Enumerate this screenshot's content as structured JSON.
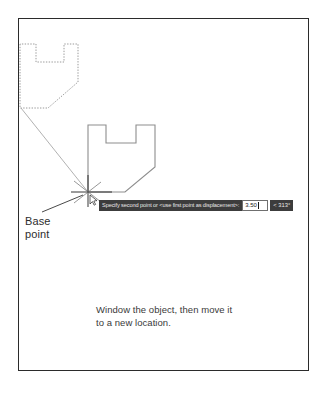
{
  "figure": {
    "frame_color": "#2b2b2b",
    "background": "#ffffff"
  },
  "annotations": {
    "base_point_label": "Base\npoint",
    "caption": "Window the object, then move it\nto a new location."
  },
  "command_bar": {
    "prompt": "Specify second point or <use first point as displacement>:",
    "distance_value": "3.50",
    "angle_value": "< 313°",
    "prompt_bg": "#3c3c3c",
    "prompt_fg": "#e8e8e8",
    "input_bg": "#ffffff",
    "input_fg": "#1a1a1a"
  },
  "geometry": {
    "ghost_shape": {
      "name": "ghost-object-outline",
      "style": "dotted",
      "stroke": "#9a9a9a",
      "points": "20,44 20,108 48,108 78,82 78,44 64,44 64,62 36,62 36,44"
    },
    "solid_shape": {
      "name": "moved-object-outline",
      "style": "solid",
      "stroke": "#8d8d8d",
      "points": "88,125 88,192 125,192 155,167 155,125 136,125 136,143 106,143 106,125"
    },
    "leader_line": {
      "name": "ghost-to-basepoint-leader",
      "stroke": "#8d8d8d",
      "x1": 21,
      "y1": 108,
      "x2": 88,
      "y2": 192
    },
    "label_leader_line": {
      "name": "base-point-leader",
      "stroke": "#4a4a4a",
      "x1": 42,
      "y1": 213,
      "x2": 82,
      "y2": 196
    },
    "crosshair": {
      "name": "crosshair-cursor",
      "stroke": "#1f1f1f",
      "cx": 88,
      "cy": 192
    }
  }
}
